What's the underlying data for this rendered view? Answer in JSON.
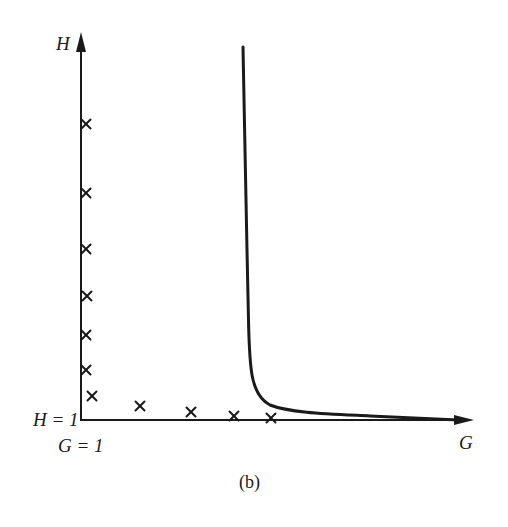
{
  "figure": {
    "caption": "(b)",
    "axes": {
      "x_label": "G",
      "y_label": "H",
      "origin_labels": {
        "h": "H = 1",
        "g": "G = 1"
      }
    },
    "colors": {
      "ink": "#1a1a1a",
      "background": "#ffffff"
    }
  },
  "chart_data": {
    "type": "scatter",
    "title": "",
    "caption": "(b)",
    "xlabel": "G",
    "ylabel": "H",
    "origin": {
      "x_label": "G = 1",
      "y_label": "H = 1"
    },
    "grid": false,
    "legend": null,
    "series": [
      {
        "name": "crosses",
        "marker": "x",
        "points_px": [
          [
            86,
            124
          ],
          [
            86,
            193
          ],
          [
            86,
            249
          ],
          [
            87,
            296
          ],
          [
            86,
            335
          ],
          [
            86,
            370
          ],
          [
            92,
            396
          ],
          [
            140,
            406
          ],
          [
            191,
            412
          ],
          [
            234,
            416
          ],
          [
            271,
            418
          ]
        ]
      },
      {
        "name": "curve",
        "marker": "line",
        "description": "hyperbola-like curve: near-vertical at G≈constant rising to top, bending sharply near H=1 and asymptotically approaching the G axis",
        "points_px": [
          [
            243,
            47
          ],
          [
            245,
            150
          ],
          [
            247,
            250
          ],
          [
            249,
            330
          ],
          [
            251,
            362
          ],
          [
            255,
            384
          ],
          [
            262,
            398
          ],
          [
            275,
            407
          ],
          [
            300,
            412
          ],
          [
            350,
            415
          ],
          [
            400,
            417
          ],
          [
            450,
            419
          ]
        ]
      }
    ]
  }
}
